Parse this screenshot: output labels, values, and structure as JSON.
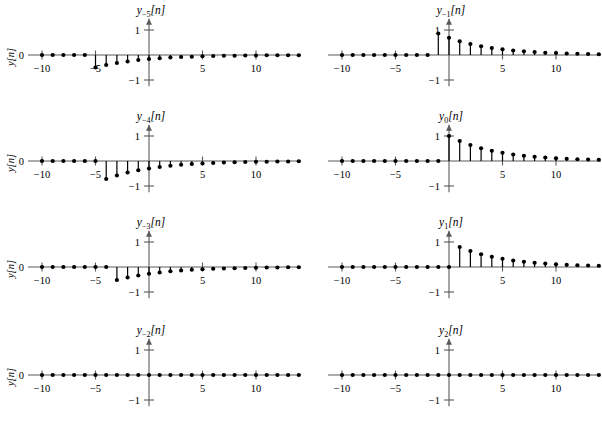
{
  "figure": {
    "ylabel": "y[n]",
    "xlabel": "n",
    "ytick_labels": [
      "1",
      "0",
      "-1"
    ],
    "xtick_labels": [
      "-10",
      "-5",
      "5",
      "10",
      "15",
      "20"
    ],
    "axis_color": "#5a5a5a",
    "marker_color": "#000000"
  },
  "chart_data": [
    {
      "id": "y-5",
      "type": "line",
      "title": "y_{-5}[n]",
      "title_base": "y",
      "title_sub": "−5",
      "title_brk": "[n]",
      "xlabel": "n",
      "ylabel": "y[n]",
      "xlim": [
        -11,
        22
      ],
      "ylim": [
        -1.45,
        1.45
      ],
      "xticks": [
        -10,
        -5,
        5,
        10,
        15,
        20
      ],
      "yticks": [
        -1,
        0,
        1
      ],
      "grid": false,
      "legend": "none",
      "x": [
        -10,
        -9,
        -8,
        -7,
        -6,
        -5,
        -4,
        -3,
        -2,
        -1,
        0,
        1,
        2,
        3,
        4,
        5,
        6,
        7,
        8,
        9,
        10,
        11,
        12,
        13,
        14,
        15,
        16,
        17,
        18,
        19,
        20
      ],
      "values": [
        0,
        0,
        0,
        0,
        0,
        -0.5,
        -0.4,
        -0.32,
        -0.26,
        -0.2,
        -0.16,
        -0.13,
        -0.1,
        -0.08,
        -0.07,
        -0.05,
        -0.04,
        -0.03,
        -0.03,
        -0.02,
        -0.02,
        -0.01,
        -0.01,
        -0.01,
        -0.01,
        0,
        0,
        0,
        0,
        0,
        0
      ]
    },
    {
      "id": "y-4",
      "type": "line",
      "title": "y_{-4}[n]",
      "title_base": "y",
      "title_sub": "−4",
      "title_brk": "[n]",
      "xlabel": "n",
      "ylabel": "y[n]",
      "xlim": [
        -11,
        22
      ],
      "ylim": [
        -1.45,
        1.45
      ],
      "xticks": [
        -10,
        -5,
        5,
        10,
        15,
        20
      ],
      "yticks": [
        -1,
        0,
        1
      ],
      "grid": false,
      "legend": "none",
      "x": [
        -10,
        -9,
        -8,
        -7,
        -6,
        -5,
        -4,
        -3,
        -2,
        -1,
        0,
        1,
        2,
        3,
        4,
        5,
        6,
        7,
        8,
        9,
        10,
        11,
        12,
        13,
        14,
        15,
        16,
        17,
        18,
        19,
        20
      ],
      "values": [
        0,
        0,
        0,
        0,
        0,
        0,
        -0.72,
        -0.58,
        -0.46,
        -0.37,
        -0.3,
        -0.24,
        -0.19,
        -0.15,
        -0.12,
        -0.1,
        -0.08,
        -0.06,
        -0.05,
        -0.04,
        -0.03,
        -0.03,
        -0.02,
        -0.02,
        -0.01,
        -0.01,
        -0.01,
        0,
        0,
        0,
        0
      ]
    },
    {
      "id": "y-3",
      "type": "line",
      "title": "y_{-3}[n]",
      "title_base": "y",
      "title_sub": "−3",
      "title_brk": "[n]",
      "xlabel": "n",
      "ylabel": "y[n]",
      "xlim": [
        -11,
        22
      ],
      "ylim": [
        -1.45,
        1.45
      ],
      "xticks": [
        -10,
        -5,
        5,
        10,
        15,
        20
      ],
      "yticks": [
        -1,
        0,
        1
      ],
      "grid": false,
      "legend": "none",
      "x": [
        -10,
        -9,
        -8,
        -7,
        -6,
        -5,
        -4,
        -3,
        -2,
        -1,
        0,
        1,
        2,
        3,
        4,
        5,
        6,
        7,
        8,
        9,
        10,
        11,
        12,
        13,
        14,
        15,
        16,
        17,
        18,
        19,
        20
      ],
      "values": [
        0,
        0,
        0,
        0,
        0,
        0,
        0,
        -0.52,
        -0.42,
        -0.34,
        -0.27,
        -0.22,
        -0.17,
        -0.14,
        -0.11,
        -0.09,
        -0.07,
        -0.06,
        -0.05,
        -0.04,
        -0.03,
        -0.02,
        -0.02,
        -0.01,
        -0.01,
        -0.01,
        0,
        0,
        0,
        0,
        0
      ]
    },
    {
      "id": "y-2",
      "type": "line",
      "title": "y_{-2}[n]",
      "title_base": "y",
      "title_sub": "−2",
      "title_brk": "[n]",
      "xlabel": "n",
      "ylabel": "y[n]",
      "xlim": [
        -11,
        22
      ],
      "ylim": [
        -1.45,
        1.45
      ],
      "xticks": [
        -10,
        -5,
        5,
        10,
        15,
        20
      ],
      "yticks": [
        -1,
        0,
        1
      ],
      "grid": false,
      "legend": "none",
      "x": [
        -10,
        -9,
        -8,
        -7,
        -6,
        -5,
        -4,
        -3,
        -2,
        -1,
        0,
        1,
        2,
        3,
        4,
        5,
        6,
        7,
        8,
        9,
        10,
        11,
        12,
        13,
        14,
        15,
        16,
        17,
        18,
        19,
        20
      ],
      "values": [
        0,
        0,
        0,
        0,
        0,
        0,
        0,
        0,
        0,
        0,
        0,
        0,
        0,
        0,
        0,
        0,
        0,
        0,
        0,
        0,
        0,
        0,
        0,
        0,
        0,
        0,
        0,
        0,
        0,
        0,
        0
      ]
    },
    {
      "id": "y-1",
      "type": "line",
      "title": "y_{-1}[n]",
      "title_base": "y",
      "title_sub": "−1",
      "title_brk": "[n]",
      "xlabel": "n",
      "ylabel": "y[n]",
      "xlim": [
        -11,
        22
      ],
      "ylim": [
        -1.45,
        1.45
      ],
      "xticks": [
        -10,
        -5,
        5,
        10,
        15,
        20
      ],
      "yticks": [
        -1,
        0,
        1
      ],
      "grid": false,
      "legend": "none",
      "x": [
        -10,
        -9,
        -8,
        -7,
        -6,
        -5,
        -4,
        -3,
        -2,
        -1,
        0,
        1,
        2,
        3,
        4,
        5,
        6,
        7,
        8,
        9,
        10,
        11,
        12,
        13,
        14,
        15,
        16,
        17,
        18,
        19,
        20
      ],
      "values": [
        0,
        0,
        0,
        0,
        0,
        0,
        0,
        0,
        0,
        0.86,
        0.69,
        0.55,
        0.44,
        0.35,
        0.28,
        0.23,
        0.18,
        0.15,
        0.12,
        0.09,
        0.08,
        0.06,
        0.05,
        0.04,
        0.03,
        0.03,
        0.02,
        0.02,
        0.01,
        0.01,
        0.01
      ]
    },
    {
      "id": "y0",
      "type": "line",
      "title": "y_{0}[n]",
      "title_base": "y",
      "title_sub": "0",
      "title_brk": "[n]",
      "xlabel": "n",
      "ylabel": "y[n]",
      "xlim": [
        -11,
        22
      ],
      "ylim": [
        -1.45,
        1.45
      ],
      "xticks": [
        -10,
        -5,
        5,
        10,
        15,
        20
      ],
      "yticks": [
        -1,
        0,
        1
      ],
      "grid": false,
      "legend": "none",
      "x": [
        -10,
        -9,
        -8,
        -7,
        -6,
        -5,
        -4,
        -3,
        -2,
        -1,
        0,
        1,
        2,
        3,
        4,
        5,
        6,
        7,
        8,
        9,
        10,
        11,
        12,
        13,
        14,
        15,
        16,
        17,
        18,
        19,
        20
      ],
      "values": [
        0,
        0,
        0,
        0,
        0,
        0,
        0,
        0,
        0,
        0,
        1.0,
        0.8,
        0.64,
        0.51,
        0.41,
        0.33,
        0.26,
        0.21,
        0.17,
        0.14,
        0.11,
        0.09,
        0.07,
        0.06,
        0.05,
        0.04,
        0.03,
        0.02,
        0.02,
        0.02,
        0.01
      ]
    },
    {
      "id": "y1",
      "type": "line",
      "title": "y_{1}[n]",
      "title_base": "y",
      "title_sub": "1",
      "title_brk": "[n]",
      "xlabel": "n",
      "ylabel": "y[n]",
      "xlim": [
        -11,
        22
      ],
      "ylim": [
        -1.45,
        1.45
      ],
      "xticks": [
        -10,
        -5,
        5,
        10,
        15,
        20
      ],
      "yticks": [
        -1,
        0,
        1
      ],
      "grid": false,
      "legend": "none",
      "x": [
        -10,
        -9,
        -8,
        -7,
        -6,
        -5,
        -4,
        -3,
        -2,
        -1,
        0,
        1,
        2,
        3,
        4,
        5,
        6,
        7,
        8,
        9,
        10,
        11,
        12,
        13,
        14,
        15,
        16,
        17,
        18,
        19,
        20
      ],
      "values": [
        0,
        0,
        0,
        0,
        0,
        0,
        0,
        0,
        0,
        0,
        0,
        0.8,
        0.64,
        0.51,
        0.41,
        0.33,
        0.26,
        0.21,
        0.17,
        0.14,
        0.11,
        0.09,
        0.07,
        0.06,
        0.05,
        0.04,
        0.03,
        0.02,
        0.02,
        0.02,
        0.01
      ]
    },
    {
      "id": "y2",
      "type": "line",
      "title": "y_{2}[n]",
      "title_base": "y",
      "title_sub": "2",
      "title_brk": "[n]",
      "xlabel": "n",
      "ylabel": "y[n]",
      "xlim": [
        -11,
        22
      ],
      "ylim": [
        -1.45,
        1.45
      ],
      "xticks": [
        -10,
        -5,
        5,
        10,
        15,
        20
      ],
      "yticks": [
        -1,
        0,
        1
      ],
      "grid": false,
      "legend": "none",
      "x": [
        -10,
        -9,
        -8,
        -7,
        -6,
        -5,
        -4,
        -3,
        -2,
        -1,
        0,
        1,
        2,
        3,
        4,
        5,
        6,
        7,
        8,
        9,
        10,
        11,
        12,
        13,
        14,
        15,
        16,
        17,
        18,
        19,
        20
      ],
      "values": [
        0,
        0,
        0,
        0,
        0,
        0,
        0,
        0,
        0,
        0,
        0,
        0,
        0,
        0,
        0,
        0,
        0,
        0,
        0,
        0,
        0,
        0,
        0,
        0,
        0,
        0,
        0,
        0,
        0,
        0,
        0
      ]
    }
  ]
}
